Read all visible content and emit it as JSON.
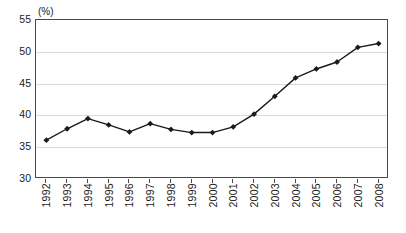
{
  "chart_data": {
    "type": "line",
    "title": "",
    "subtitle": "",
    "unit_label": "(%)",
    "xlabel": "",
    "ylabel": "",
    "categories": [
      "1992",
      "1993",
      "1994",
      "1995",
      "1996",
      "1997",
      "1998",
      "1999",
      "2000",
      "2001",
      "2002",
      "2003",
      "2004",
      "2005",
      "2006",
      "2007",
      "2008"
    ],
    "values": [
      36.1,
      37.9,
      39.5,
      38.5,
      37.4,
      38.7,
      37.8,
      37.3,
      37.3,
      38.2,
      40.2,
      43.0,
      45.9,
      47.3,
      48.4,
      50.7,
      51.3
    ],
    "ylim": [
      30,
      55
    ],
    "yticks": [
      30,
      35,
      40,
      45,
      50,
      55
    ],
    "ytick_labels": [
      "30",
      "35",
      "40",
      "45",
      "50",
      "55"
    ],
    "grid": true,
    "legend": "none",
    "series": [
      {
        "name": "",
        "color": "#1a1a1a",
        "marker": "diamond",
        "values": [
          36.1,
          37.9,
          39.5,
          38.5,
          37.4,
          38.7,
          37.8,
          37.3,
          37.3,
          38.2,
          40.2,
          43.0,
          45.9,
          47.3,
          48.4,
          50.7,
          51.3
        ]
      }
    ]
  },
  "style": {
    "line_color": "#1a1a1a",
    "grid_color": "#d9d9d9",
    "axis_color": "#4a4a4a",
    "background": "#ffffff"
  }
}
